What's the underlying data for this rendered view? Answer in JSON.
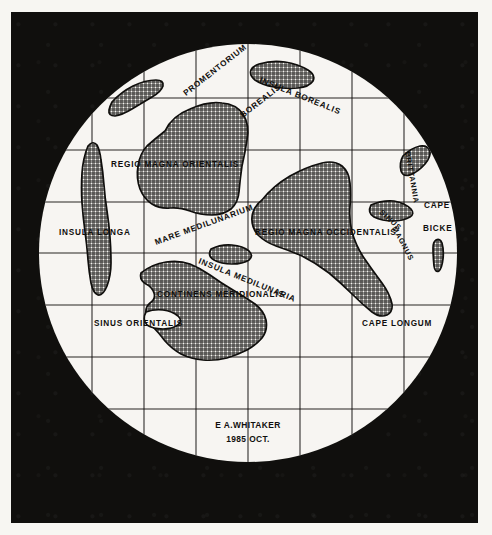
{
  "document": {
    "kind": "hand-drawn lunar hemisphere map",
    "background_color": "#100f0d",
    "disc_color": "#f7f6f2",
    "ink_color": "#100f0d"
  },
  "signature": {
    "author": "E A.WHITAKER",
    "date": "1985 OCT."
  },
  "labels": [
    {
      "id": "promentorium-borealis",
      "text": "PROMENTORIUM",
      "x": 186,
      "y": 96,
      "rotate": -38,
      "size": "md"
    },
    {
      "id": "borealis-2",
      "text": "BOREALIS",
      "x": 243,
      "y": 118,
      "rotate": -38,
      "size": "md"
    },
    {
      "id": "insula-borealis",
      "text": "INSULA BOREALIS",
      "x": 259,
      "y": 82,
      "rotate": 22,
      "size": "md"
    },
    {
      "id": "regio-magna-orientalis",
      "text": "REGIO  MAGNA  ORIENTALIS",
      "x": 111,
      "y": 167,
      "rotate": 0,
      "size": "md"
    },
    {
      "id": "insula-longa",
      "text": "INSULA  LONGA",
      "x": 59,
      "y": 235,
      "rotate": 0,
      "size": "md"
    },
    {
      "id": "mare-medilunarium",
      "text": "MARE  MEDILUNARIUM",
      "x": 156,
      "y": 245,
      "rotate": -20,
      "size": "md"
    },
    {
      "id": "regio-magna-occidentalis",
      "text": "REGIO MAGNA OCCIDENTALIS",
      "x": 255,
      "y": 235,
      "rotate": 0,
      "size": "md"
    },
    {
      "id": "insula-medilunaria",
      "text": "INSULA  MEDILUNARIA",
      "x": 198,
      "y": 263,
      "rotate": 22,
      "size": "md"
    },
    {
      "id": "continens-meridionalis",
      "text": "CONTINENS  MERIDIONALIS",
      "x": 157,
      "y": 297,
      "rotate": 0,
      "size": "md"
    },
    {
      "id": "sinus-orientalis",
      "text": "SINUS ORIENTALIS",
      "x": 94,
      "y": 326,
      "rotate": 0,
      "size": "md"
    },
    {
      "id": "cape-longum",
      "text": "CAPE  LONGUM",
      "x": 362,
      "y": 326,
      "rotate": 0,
      "size": "md"
    },
    {
      "id": "brittannia",
      "text": "BRITTANNIA",
      "x": 405,
      "y": 152,
      "rotate": 80,
      "size": "sm"
    },
    {
      "id": "cape",
      "text": "CAPE",
      "x": 424,
      "y": 208,
      "rotate": 0,
      "size": "md"
    },
    {
      "id": "bicke",
      "text": "BICKE",
      "x": 423,
      "y": 231,
      "rotate": 0,
      "size": "md"
    },
    {
      "id": "sinus",
      "text": "SINUS",
      "x": 379,
      "y": 213,
      "rotate": 42,
      "size": "sm"
    },
    {
      "id": "magnus",
      "text": "MAGNUS",
      "x": 392,
      "y": 228,
      "rotate": 62,
      "size": "sm"
    }
  ],
  "landmasses": [
    {
      "id": "regio-magna-orientalis-shape",
      "name": "Regio Magna Orientalis"
    },
    {
      "id": "regio-magna-occidentalis-shape",
      "name": "Regio Magna Occidentalis"
    },
    {
      "id": "continens-meridionalis-shape",
      "name": "Continens Meridionalis"
    },
    {
      "id": "insula-longa-shape",
      "name": "Insula Longa"
    },
    {
      "id": "insula-borealis-shape",
      "name": "Insula Borealis"
    },
    {
      "id": "insula-medilunaria-shape",
      "name": "Insula Medilunaria"
    },
    {
      "id": "promentorium-borealis-shape",
      "name": "Promentorium Borealis"
    },
    {
      "id": "brittannia-shape",
      "name": "Brittannia"
    },
    {
      "id": "sinus-magnus-shape",
      "name": "Sinus Magnus"
    },
    {
      "id": "small-islet-shape",
      "name": "unnamed islet"
    }
  ],
  "graticule": {
    "spacing_px": 52,
    "vertical_lines": [
      92,
      144,
      196,
      248,
      300,
      352,
      404
    ],
    "horizontal_lines": [
      98,
      150,
      202,
      253,
      305,
      357,
      409
    ]
  },
  "disc": {
    "cx": 248,
    "cy": 253,
    "r": 209
  }
}
